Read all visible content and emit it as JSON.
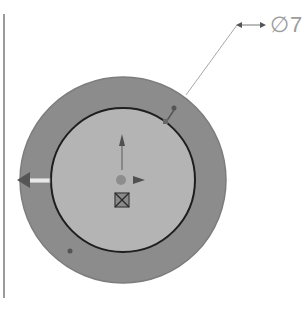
{
  "viewport": {
    "background": "#ffffff"
  },
  "model": {
    "outer_circle": {
      "fill": "#8c8c8c",
      "stroke": "#7a7a7a",
      "cx": 123,
      "cy": 180,
      "r": 103
    },
    "inner_circle": {
      "fill": "#b4b4b4",
      "stroke": "#1e1e1e",
      "cx": 123,
      "cy": 180,
      "r": 72
    }
  },
  "dimension": {
    "label": "∅7",
    "symbol": "diameter",
    "value": "7",
    "color": "#9c9c9c"
  },
  "triad": {
    "icons": [
      "y-axis-arrow-icon",
      "x-axis-arrow-icon",
      "origin-icon",
      "reference-triad-icon"
    ]
  },
  "handles": {
    "drag_arrow": "drag-arrow-icon",
    "points": [
      "control-point-top-right",
      "control-point-bottom-left"
    ]
  }
}
